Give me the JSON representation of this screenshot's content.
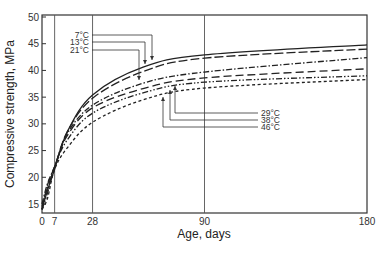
{
  "chart_data": {
    "type": "line",
    "title": "",
    "xlabel": "Age, days",
    "ylabel": "Compressive strength, MPa",
    "xlim": [
      0,
      180
    ],
    "ylim": [
      13.5,
      50
    ],
    "x_ticks": [
      0,
      7,
      28,
      90,
      180
    ],
    "y_ticks": [
      15,
      20,
      25,
      30,
      35,
      40,
      45,
      50
    ],
    "grid": "vertical lines at 7, 28, 90 days",
    "legend": "leader-line annotations",
    "x": [
      0,
      3,
      7,
      14,
      28,
      56,
      90,
      180
    ],
    "series": [
      {
        "name": "7°C",
        "style": "solid",
        "values": [
          14.0,
          17.5,
          21.5,
          28.5,
          35.4,
          40.6,
          42.9,
          44.8
        ]
      },
      {
        "name": "13°C",
        "style": "long-dash",
        "values": [
          14.5,
          18.0,
          21.8,
          28.5,
          34.8,
          39.8,
          42.3,
          44.0
        ]
      },
      {
        "name": "21°C",
        "style": "dash-dot",
        "values": [
          15.0,
          18.8,
          22.0,
          28.2,
          33.5,
          37.6,
          39.7,
          42.4
        ]
      },
      {
        "name": "29°C",
        "style": "long-dash-2",
        "values": [
          14.0,
          18.5,
          22.0,
          27.8,
          33.0,
          36.6,
          38.6,
          40.3
        ]
      },
      {
        "name": "38°C",
        "style": "dash-dot-dot",
        "values": [
          14.0,
          17.0,
          22.0,
          27.0,
          32.0,
          35.8,
          37.8,
          39.0
        ]
      },
      {
        "name": "46°C",
        "style": "short-dash",
        "values": [
          14.0,
          16.0,
          21.5,
          25.5,
          30.3,
          34.5,
          36.7,
          38.3
        ]
      }
    ]
  },
  "labels": {
    "xlabel": "Age, days",
    "ylabel": "Compressive strength, MPa",
    "x_ticks": [
      "0",
      "7",
      "28",
      "90",
      "180"
    ],
    "y_ticks": [
      "15",
      "20",
      "25",
      "30",
      "35",
      "40",
      "45",
      "50"
    ],
    "annotations": [
      "7°C",
      "13°C",
      "21°C",
      "29°C",
      "38°C",
      "46°C"
    ]
  }
}
